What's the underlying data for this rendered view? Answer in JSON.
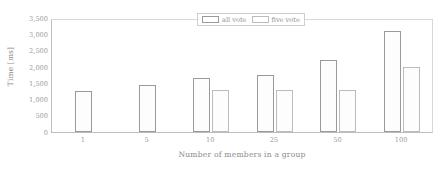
{
  "chart_data": {
    "type": "bar",
    "title": "",
    "xlabel": "Number of members in a group",
    "ylabel": "Time [ms]",
    "categories": [
      "1",
      "5",
      "10",
      "25",
      "50",
      "100"
    ],
    "series": [
      {
        "name": "all vote",
        "values": [
          1250,
          1450,
          1650,
          1750,
          2200,
          3100
        ]
      },
      {
        "name": "five vote",
        "values": [
          null,
          null,
          1300,
          1300,
          1300,
          2000
        ]
      }
    ],
    "ylim": [
      0,
      3500
    ],
    "ytick_values": [
      0,
      500,
      1000,
      1500,
      2000,
      2500,
      3000,
      3500
    ],
    "ytick_labels": [
      "0",
      "500",
      "1,000",
      "1,500",
      "2,000",
      "2,500",
      "3,000",
      "3,500"
    ],
    "grid": false,
    "legend_position": "top-center",
    "legend_entries": [
      "all vote",
      "five vote"
    ],
    "bar_style": "outlined-white",
    "outline_colors": [
      "#9a9a9a",
      "#bcbcbc"
    ],
    "annotations": []
  }
}
